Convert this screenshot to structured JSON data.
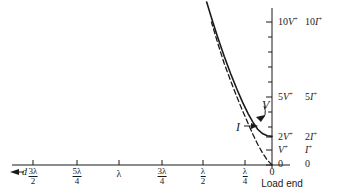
{
  "figure": {
    "kind": "transmission-line-standing-wave",
    "ink_color": "#1a1a1a",
    "background": "#ffffff"
  },
  "axes": {
    "x_axis_label": "d",
    "x_axis_arrow": "left-arrow",
    "origin_label": "0",
    "load_end_label": "Load end",
    "x_ticks": [
      {
        "px": 33,
        "num": "3λ",
        "den": "2",
        "plain": null
      },
      {
        "px": 77,
        "num": "5λ",
        "den": "4",
        "plain": null
      },
      {
        "px": 119,
        "num": null,
        "den": null,
        "plain": "λ"
      },
      {
        "px": 162,
        "num": "3λ",
        "den": "4",
        "plain": null
      },
      {
        "px": 203,
        "num": "λ",
        "den": "2",
        "plain": null
      },
      {
        "px": 245,
        "num": "λ",
        "den": "4",
        "plain": null
      }
    ],
    "y_ticks": [
      {
        "px": 22,
        "v_label": "10V",
        "i_label": "10I",
        "sup": "+",
        "major": true
      },
      {
        "px": 37,
        "v_label": "",
        "i_label": "",
        "sup": "",
        "major": false
      },
      {
        "px": 52,
        "v_label": "",
        "i_label": "",
        "sup": "",
        "major": false
      },
      {
        "px": 67,
        "v_label": "",
        "i_label": "",
        "sup": "",
        "major": false
      },
      {
        "px": 82,
        "v_label": "",
        "i_label": "",
        "sup": "",
        "major": false
      },
      {
        "px": 97,
        "v_label": "5V",
        "i_label": "5I",
        "sup": "+",
        "major": true
      },
      {
        "px": 112,
        "v_label": "",
        "i_label": "",
        "sup": "",
        "major": false
      },
      {
        "px": 127,
        "v_label": "",
        "i_label": "",
        "sup": "",
        "major": false
      },
      {
        "px": 137,
        "v_label": "2V",
        "i_label": "2I",
        "sup": "+",
        "major": true
      },
      {
        "px": 150,
        "v_label": "V",
        "i_label": "I",
        "sup": "+",
        "major": true
      },
      {
        "px": 165,
        "v_label": "0",
        "i_label": "0",
        "sup": "",
        "major": true
      }
    ]
  },
  "curve_labels": [
    {
      "name": "voltage-curve-label",
      "text": "V",
      "x": 262,
      "y": 98
    },
    {
      "name": "current-curve-label",
      "text": "I",
      "x": 236,
      "y": 120
    }
  ],
  "chart_data": {
    "type": "line",
    "title": "",
    "xlabel": "d",
    "ylabel": "",
    "grid": false,
    "legend": "inline-annotations",
    "x_unit": "wavelengths from load end",
    "x_tick_labels": [
      "3λ/2",
      "5λ/4",
      "λ",
      "3λ/4",
      "λ/2",
      "λ/4",
      "0"
    ],
    "y_tick_labels": [
      "0",
      "V+ / I+",
      "2V+ / 2I+",
      "5V+ / 5I+",
      "10V+ / 10I+"
    ],
    "ylim": [
      0,
      11
    ],
    "xlim_wavelengths": [
      1.6,
      0
    ],
    "series": [
      {
        "name": "V",
        "style": "solid",
        "points": [
          {
            "x_wl": 0.0,
            "y": 2.0
          },
          {
            "x_wl": 0.03,
            "y": 2.05
          },
          {
            "x_wl": 0.06,
            "y": 2.2
          },
          {
            "x_wl": 0.09,
            "y": 2.5
          },
          {
            "x_wl": 0.12,
            "y": 3.0
          },
          {
            "x_wl": 0.15,
            "y": 3.6
          },
          {
            "x_wl": 0.185,
            "y": 4.4
          },
          {
            "x_wl": 0.22,
            "y": 5.3
          },
          {
            "x_wl": 0.26,
            "y": 6.4
          },
          {
            "x_wl": 0.3,
            "y": 7.6
          },
          {
            "x_wl": 0.34,
            "y": 8.9
          },
          {
            "x_wl": 0.38,
            "y": 10.3
          },
          {
            "x_wl": 0.41,
            "y": 11.4
          }
        ]
      },
      {
        "name": "I",
        "style": "dashed",
        "points": [
          {
            "x_wl": 0.0,
            "y": 0.0
          },
          {
            "x_wl": 0.03,
            "y": 0.35
          },
          {
            "x_wl": 0.06,
            "y": 0.85
          },
          {
            "x_wl": 0.09,
            "y": 1.45
          },
          {
            "x_wl": 0.12,
            "y": 2.15
          },
          {
            "x_wl": 0.15,
            "y": 2.9
          },
          {
            "x_wl": 0.185,
            "y": 3.8
          },
          {
            "x_wl": 0.22,
            "y": 4.75
          },
          {
            "x_wl": 0.26,
            "y": 5.9
          },
          {
            "x_wl": 0.3,
            "y": 7.1
          },
          {
            "x_wl": 0.34,
            "y": 8.5
          },
          {
            "x_wl": 0.38,
            "y": 10.0
          }
        ]
      }
    ],
    "annotations": [
      {
        "text": "V",
        "target": "solid-curve"
      },
      {
        "text": "I",
        "target": "dashed-curve"
      },
      {
        "text": "Load end",
        "target": "x-origin"
      }
    ]
  }
}
